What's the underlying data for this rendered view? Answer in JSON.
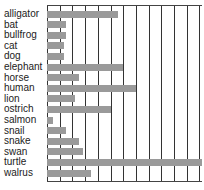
{
  "chart_data": {
    "type": "bar",
    "orientation": "horizontal",
    "title": "",
    "xlabel": "",
    "ylabel": "",
    "grid": true,
    "xlim": [
      0,
      122
    ],
    "grid_step": 10,
    "categories": [
      "alligator",
      "bat",
      "bullfrog",
      "cat",
      "dog",
      "elephant",
      "horse",
      "human",
      "lion",
      "ostrich",
      "salmon",
      "snail",
      "snake",
      "swan",
      "turtle",
      "walrus"
    ],
    "values": [
      56,
      15,
      15,
      13,
      13,
      60,
      25,
      70,
      22,
      50,
      5,
      15,
      25,
      28,
      122,
      35
    ],
    "bar_color": "#9a9a9a",
    "grid_color": "#333333"
  }
}
